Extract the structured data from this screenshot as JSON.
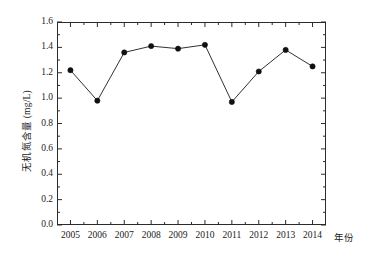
{
  "chart_data": {
    "type": "line",
    "title": "",
    "xlabel": "年份",
    "ylabel": "无机氮含量 (mg/L)",
    "categories": [
      "2005",
      "2006",
      "2007",
      "2008",
      "2009",
      "2010",
      "2011",
      "2012",
      "2013",
      "2014"
    ],
    "values": [
      1.22,
      0.98,
      1.36,
      1.41,
      1.39,
      1.42,
      0.97,
      1.21,
      1.38,
      1.25
    ],
    "series": [
      {
        "name": "无机氮含量",
        "values": [
          1.22,
          0.98,
          1.36,
          1.41,
          1.39,
          1.42,
          0.97,
          1.21,
          1.38,
          1.25
        ],
        "marker": "filled-circle",
        "color": "#1a1a1a"
      }
    ],
    "ylim": [
      0.0,
      1.6
    ],
    "yticks": [
      "0.0",
      "0.2",
      "0.4",
      "0.6",
      "0.8",
      "1.0",
      "1.2",
      "1.4",
      "1.6"
    ],
    "ytick_values": [
      0.0,
      0.2,
      0.4,
      0.6,
      0.8,
      1.0,
      1.2,
      1.4,
      1.6
    ],
    "xticks": [
      "2005",
      "2006",
      "2007",
      "2008",
      "2009",
      "2010",
      "2011",
      "2012",
      "2013",
      "2014"
    ],
    "grid": false,
    "legend": "none",
    "minor_ticks": true,
    "tick_direction": "in",
    "frame": "box",
    "line_color": "#333333",
    "marker_color": "#111111",
    "axis_color": "#2b2b2b"
  }
}
